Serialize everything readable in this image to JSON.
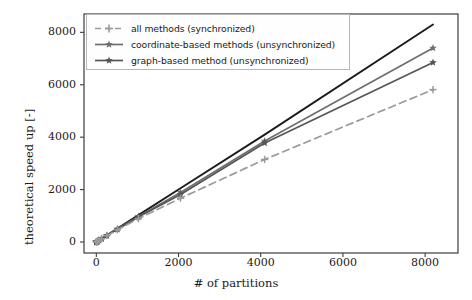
{
  "chart_data": {
    "type": "line",
    "title": "",
    "xlabel": "# of partitions",
    "ylabel": "theoretical speed up [-]",
    "xlim": [
      -300,
      8800
    ],
    "ylim": [
      -420,
      8700
    ],
    "xticks": [
      "0",
      "2000",
      "4000",
      "6000",
      "8000"
    ],
    "xtick_values": [
      0,
      2000,
      4000,
      6000,
      8000
    ],
    "yticks": [
      "0",
      "2000",
      "4000",
      "6000",
      "8000"
    ],
    "ytick_values": [
      0,
      2000,
      4000,
      6000,
      8000
    ],
    "grid": false,
    "legend_position": "upper left",
    "x": [
      1,
      2,
      4,
      8,
      16,
      32,
      64,
      128,
      256,
      512,
      1024,
      2048,
      4096,
      8192
    ],
    "series": [
      {
        "name": "ideal",
        "label": "",
        "in_legend": false,
        "color": "#1c1c1c",
        "linestyle": "solid",
        "marker": "none",
        "linewidth": 1.9,
        "values": [
          1,
          2,
          4,
          8,
          16,
          32,
          64,
          128,
          256,
          512,
          1024,
          2048,
          4096,
          8300
        ]
      },
      {
        "name": "coordinate-based-unsync",
        "label": "coordinate-based methods (unsynchronized)",
        "in_legend": true,
        "color": "#6e6e6e",
        "linestyle": "solid",
        "marker": "star",
        "linewidth": 1.7,
        "values": [
          1,
          2,
          4,
          8,
          16,
          32,
          63,
          126,
          250,
          495,
          975,
          1890,
          3850,
          7400
        ]
      },
      {
        "name": "graph-based-unsync",
        "label": "graph-based method (unsynchronized)",
        "in_legend": true,
        "color": "#555555",
        "linestyle": "solid",
        "marker": "star",
        "linewidth": 1.7,
        "values": [
          1,
          2,
          4,
          8,
          16,
          32,
          63,
          125,
          247,
          487,
          950,
          1810,
          3780,
          6850
        ]
      },
      {
        "name": "all-methods-sync",
        "label": "all methods (synchronized)",
        "in_legend": true,
        "color": "#9a9a9a",
        "linestyle": "dashed",
        "marker": "plus",
        "linewidth": 1.7,
        "values": [
          1,
          2,
          4,
          8,
          16,
          32,
          62,
          122,
          240,
          465,
          890,
          1670,
          3150,
          5815
        ]
      }
    ],
    "legend_entries": [
      {
        "label": "all methods (synchronized)",
        "color": "#9a9a9a",
        "linestyle": "dashed",
        "marker": "plus"
      },
      {
        "label": "coordinate-based methods (unsynchronized)",
        "color": "#6e6e6e",
        "linestyle": "solid",
        "marker": "star"
      },
      {
        "label": "graph-based method (unsynchronized)",
        "color": "#555555",
        "linestyle": "solid",
        "marker": "star"
      }
    ],
    "axis_color": "#3d3d3d"
  }
}
